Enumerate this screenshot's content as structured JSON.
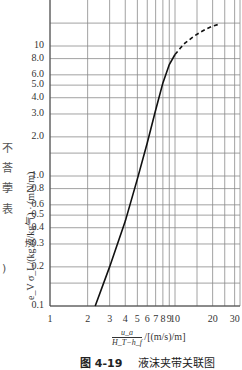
{
  "edge_text": [
    "不",
    "荅",
    "荸",
    "表",
    ")"
  ],
  "chart_data": {
    "type": "line",
    "title": "",
    "caption_number": "图 4-19",
    "caption_text": "液沫夹带关联图",
    "xlabel_numerator": "u_a",
    "xlabel_denominator": "H_T−h_f",
    "xlabel_unit": "/[(m/s)/m]",
    "ylabel": "e_V σ_L/(kg液/kg气) · (mN/m)",
    "xscale": "log",
    "yscale": "log",
    "xlim": [
      1,
      32
    ],
    "ylim": [
      0.1,
      20
    ],
    "grid": true,
    "x_ticks": [
      1,
      2,
      3,
      4,
      5,
      6,
      7,
      8,
      9,
      10,
      20,
      30
    ],
    "x_tick_labels": [
      "1",
      "2",
      "3",
      "4",
      "5",
      "6",
      "7",
      "8",
      "9",
      "10",
      "20",
      "30"
    ],
    "y_ticks": [
      0.1,
      0.2,
      0.3,
      0.4,
      0.5,
      0.6,
      0.8,
      1.0,
      2.0,
      3.0,
      4.0,
      5.0,
      6.0,
      8.0,
      10
    ],
    "y_tick_labels": [
      "0.1",
      "0.2",
      "0.3",
      "0.4",
      "0.5",
      "0.6",
      "0.8",
      "1.0",
      "2.0",
      "3.0",
      "4.0",
      "5.0",
      "6.0",
      "8.0",
      "10"
    ],
    "x_minor_grid": [
      15,
      25
    ],
    "y_minor_grid": [
      0.15,
      1.5,
      15
    ],
    "series": [
      {
        "name": "solid",
        "style": "solid",
        "x": [
          2.3,
          3,
          4,
          5,
          6,
          7,
          8,
          9,
          10
        ],
        "y": [
          0.1,
          0.2,
          0.45,
          0.95,
          1.8,
          3.2,
          5.2,
          7.2,
          8.6
        ]
      },
      {
        "name": "dashed-extrapolation",
        "style": "dashed",
        "x": [
          10,
          11,
          12,
          14,
          16,
          18,
          20,
          22
        ],
        "y": [
          8.6,
          9.6,
          10.5,
          11.8,
          12.8,
          13.6,
          14.2,
          14.6
        ]
      }
    ]
  }
}
